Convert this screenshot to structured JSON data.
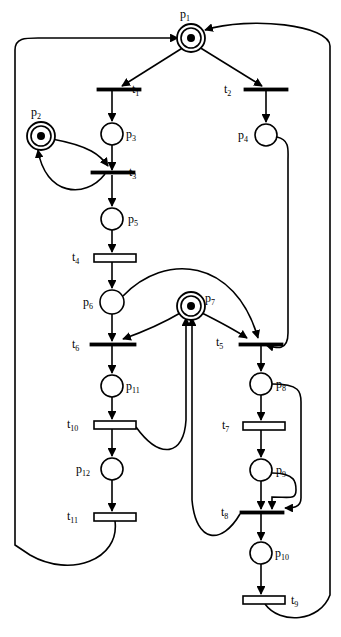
{
  "diagram": {
    "type": "petri-net",
    "title": "",
    "stroke_color": "#000000",
    "fill_color": "#ffffff",
    "background": "#ffffff",
    "width": 341,
    "height": 637
  },
  "places": [
    {
      "id": "p1",
      "label": "p",
      "sub": "1",
      "cx": 191,
      "cy": 38,
      "r": 10,
      "tokens": 1,
      "label_x": 180,
      "label_y": 8,
      "double": true
    },
    {
      "id": "p2",
      "label": "p",
      "sub": "2",
      "cx": 41,
      "cy": 136,
      "r": 10,
      "tokens": 1,
      "label_x": 31,
      "label_y": 106,
      "double": true
    },
    {
      "id": "p3",
      "label": "p",
      "sub": "3",
      "cx": 112,
      "cy": 134,
      "r": 11,
      "tokens": 0,
      "label_x": 126,
      "label_y": 128,
      "double": false
    },
    {
      "id": "p4",
      "label": "p",
      "sub": "4",
      "cx": 266,
      "cy": 135,
      "r": 11,
      "tokens": 0,
      "label_x": 238,
      "label_y": 129,
      "double": false
    },
    {
      "id": "p5",
      "label": "p",
      "sub": "5",
      "cx": 112,
      "cy": 219,
      "r": 11,
      "tokens": 0,
      "label_x": 128,
      "label_y": 213,
      "double": false
    },
    {
      "id": "p6",
      "label": "p",
      "sub": "6",
      "cx": 112,
      "cy": 302,
      "r": 12,
      "tokens": 0,
      "label_x": 83,
      "label_y": 296,
      "double": false
    },
    {
      "id": "p7",
      "label": "p",
      "sub": "7",
      "cx": 191,
      "cy": 306,
      "r": 10,
      "tokens": 1,
      "label_x": 205,
      "label_y": 292,
      "double": true
    },
    {
      "id": "p8",
      "label": "p",
      "sub": "8",
      "cx": 261,
      "cy": 384,
      "r": 11,
      "tokens": 0,
      "label_x": 276,
      "label_y": 378,
      "double": false
    },
    {
      "id": "p9",
      "label": "p",
      "sub": "9",
      "cx": 261,
      "cy": 470,
      "r": 11,
      "tokens": 0,
      "label_x": 276,
      "label_y": 464,
      "double": false
    },
    {
      "id": "p10",
      "label": "p",
      "sub": "10",
      "cx": 261,
      "cy": 553,
      "r": 11,
      "tokens": 0,
      "label_x": 275,
      "label_y": 547,
      "double": false
    },
    {
      "id": "p11",
      "label": "p",
      "sub": "11",
      "cx": 112,
      "cy": 386,
      "r": 11,
      "tokens": 0,
      "label_x": 126,
      "label_y": 380,
      "double": false
    },
    {
      "id": "p12",
      "label": "p",
      "sub": "12",
      "cx": 112,
      "cy": 469,
      "r": 11,
      "tokens": 0,
      "label_x": 76,
      "label_y": 463,
      "double": false
    }
  ],
  "transitions": [
    {
      "id": "t1",
      "label": "t",
      "sub": "1",
      "x": 97,
      "y": 88,
      "w": 44,
      "h": 3,
      "bar": "thin",
      "label_x": 132,
      "label_y": 83
    },
    {
      "id": "t2",
      "label": "t",
      "sub": "2",
      "x": 244,
      "y": 88,
      "w": 44,
      "h": 3,
      "bar": "thin",
      "label_x": 224,
      "label_y": 83
    },
    {
      "id": "t3",
      "label": "t",
      "sub": "3",
      "x": 91,
      "y": 171,
      "w": 44,
      "h": 3,
      "bar": "thin",
      "label_x": 129,
      "label_y": 166
    },
    {
      "id": "t4",
      "label": "t",
      "sub": "4",
      "x": 94,
      "y": 254,
      "w": 42,
      "h": 8,
      "bar": "thick",
      "label_x": 72,
      "label_y": 251
    },
    {
      "id": "t5",
      "label": "t",
      "sub": "5",
      "x": 239,
      "y": 343,
      "w": 44,
      "h": 3,
      "bar": "thin",
      "label_x": 216,
      "label_y": 336
    },
    {
      "id": "t6",
      "label": "t",
      "sub": "6",
      "x": 90,
      "y": 343,
      "w": 46,
      "h": 3,
      "bar": "thin",
      "label_x": 72,
      "label_y": 338
    },
    {
      "id": "t7",
      "label": "t",
      "sub": "7",
      "x": 243,
      "y": 422,
      "w": 42,
      "h": 8,
      "bar": "thick",
      "label_x": 222,
      "label_y": 419
    },
    {
      "id": "t8",
      "label": "t",
      "sub": "8",
      "x": 240,
      "y": 511,
      "w": 44,
      "h": 3,
      "bar": "thin",
      "label_x": 221,
      "label_y": 506
    },
    {
      "id": "t9",
      "label": "t",
      "sub": "9",
      "x": 243,
      "y": 596,
      "w": 42,
      "h": 8,
      "bar": "thick",
      "label_x": 291,
      "label_y": 594
    },
    {
      "id": "t10",
      "label": "t",
      "sub": "10",
      "x": 94,
      "y": 421,
      "w": 42,
      "h": 8,
      "bar": "thick",
      "label_x": 67,
      "label_y": 418
    },
    {
      "id": "t11",
      "label": "t",
      "sub": "11",
      "x": 94,
      "y": 513,
      "w": 42,
      "h": 8,
      "bar": "thick",
      "label_x": 67,
      "label_y": 510
    }
  ],
  "arcs": [
    {
      "id": "a-p1-t1",
      "from": "p1",
      "to": "t1",
      "d": "M 184 47 L 122 86"
    },
    {
      "id": "a-p1-t2",
      "from": "p1",
      "to": "t2",
      "d": "M 199 47 L 262 86"
    },
    {
      "id": "a-t1-p3",
      "from": "t1",
      "to": "p3",
      "d": "M 112 91 L 112 121"
    },
    {
      "id": "a-t2-p4",
      "from": "t2",
      "to": "p4",
      "d": "M 266 91 L 266 122"
    },
    {
      "id": "a-p3-t3",
      "from": "p3",
      "to": "t3",
      "d": "M 112 145 L 112 170"
    },
    {
      "id": "a-p2-t3",
      "from": "p2",
      "to": "t3",
      "d": "M 52 139 C 90 146 100 155 108 166"
    },
    {
      "id": "a-t3-p2",
      "from": "t3",
      "to": "p2",
      "d": "M 105 174 C 85 200 45 195 38 150"
    },
    {
      "id": "a-t3-p5",
      "from": "t3",
      "to": "p5",
      "d": "M 112 175 L 112 206"
    },
    {
      "id": "a-p5-t4",
      "from": "p5",
      "to": "t4",
      "d": "M 112 230 L 112 252"
    },
    {
      "id": "a-t4-p6",
      "from": "t4",
      "to": "p6",
      "d": "M 112 262 L 112 288"
    },
    {
      "id": "a-p6-t6",
      "from": "p6",
      "to": "t6",
      "d": "M 112 314 L 112 341"
    },
    {
      "id": "a-p6-t5",
      "from": "p6",
      "to": "t5",
      "d": "M 123 296 C 165 252 235 258 258 338"
    },
    {
      "id": "a-p7-t6",
      "from": "p7",
      "to": "t6",
      "d": "M 182 312 C 160 325 140 333 123 339"
    },
    {
      "id": "a-p7-t5",
      "from": "p7",
      "to": "t5",
      "d": "M 200 312 C 220 322 235 330 247 338"
    },
    {
      "id": "a-p4-t5",
      "from": "p4",
      "to": "t5",
      "d": "M 277 137 C 290 140 288 150 288 160 L 288 333 C 288 352 276 348 266 345"
    },
    {
      "id": "a-t5-p8",
      "from": "t5",
      "to": "p8",
      "d": "M 261 346 L 261 371"
    },
    {
      "id": "a-p8-t8",
      "from": "p8",
      "to": "t8",
      "d": "M 272 384 C 300 384 301 392 301 402 L 301 498 C 301 508 292 508 285 508"
    },
    {
      "id": "a-p8-t7",
      "from": "p8",
      "to": "t7",
      "d": "M 261 395 L 261 420"
    },
    {
      "id": "a-t7-p9",
      "from": "t7",
      "to": "p9",
      "d": "M 261 430 L 261 457"
    },
    {
      "id": "a-p9-t8",
      "from": "p9",
      "to": "t8",
      "d": "M 261 481 L 261 509"
    },
    {
      "id": "a-p9-t8b",
      "from": "p9",
      "to": "t8",
      "d": "M 272 473 C 296 473 296 483 296 490 C 296 500 290 497 272 497 L 272 509"
    },
    {
      "id": "a-t8-p7",
      "from": "t8",
      "to": "p7",
      "d": "M 240 514 C 222 545 196 544 192 500 L 192 318"
    },
    {
      "id": "a-t8-p10",
      "from": "t8",
      "to": "p10",
      "d": "M 261 514 L 261 540"
    },
    {
      "id": "a-p10-t9",
      "from": "p10",
      "to": "t9",
      "d": "M 261 564 L 261 594"
    },
    {
      "id": "a-t9-p1",
      "from": "t9",
      "to": "p1",
      "d": "M 265 604 C 280 625 320 622 330 595 L 330 46 C 330 25 250 16 205 30"
    },
    {
      "id": "a-t6-p11",
      "from": "t6",
      "to": "p11",
      "d": "M 112 346 L 112 373"
    },
    {
      "id": "a-p11-t10",
      "from": "p11",
      "to": "t10",
      "d": "M 112 397 L 112 419"
    },
    {
      "id": "a-t10-p7",
      "from": "t10",
      "to": "p7",
      "d": "M 136 427 C 160 460 184 456 186 420 L 186 318"
    },
    {
      "id": "a-t10-p12",
      "from": "t10",
      "to": "p12",
      "d": "M 112 429 L 112 456"
    },
    {
      "id": "a-p12-t11",
      "from": "p12",
      "to": "t11",
      "d": "M 112 480 L 112 511"
    },
    {
      "id": "a-t11-p1",
      "from": "t11",
      "to": "p1",
      "d": "M 115 521 C 120 560 70 578 30 555 L 15 545 L 15 50 C 15 38 25 38 38 38 L 178 38"
    }
  ],
  "legend": {
    "place_label_prefix": "p",
    "transition_label_prefix": "t",
    "marked_places": [
      "p1",
      "p2",
      "p7"
    ],
    "token_count": 3
  }
}
